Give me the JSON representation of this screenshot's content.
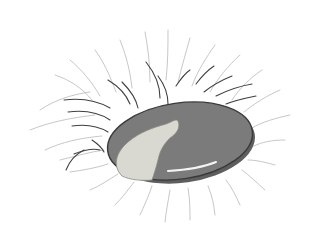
{
  "illustration": {
    "subject": "grey oval stone resting in a tuft of wispy hair strokes",
    "width": 324,
    "height": 249,
    "background": "#ffffff",
    "stone": {
      "cx": 180,
      "cy": 141,
      "rx": 73,
      "ry": 38,
      "rotate": -8,
      "fill": "#7b7b7b",
      "shade": "#5e5e5e",
      "outline": "#3a3a3a"
    },
    "patch": {
      "fill": "#d9d9d2",
      "outline": "#8a8a84",
      "d": "M122 176 C112 166 116 152 128 142 C140 132 152 128 166 124 C172 122 176 118 178 121 C181 128 176 134 170 138 C164 144 160 150 158 160 C156 168 154 174 152 180 C142 181 130 180 122 176 Z"
    },
    "highlight": {
      "stroke": "#f4f4f4",
      "d": "M168 171 C186 170 204 167 216 162"
    },
    "hair_light": {
      "color": "#b9b9b9",
      "width": 0.8,
      "paths": [
        "M40 110 C55 100 70 95 90 92",
        "M30 130 C50 122 70 118 95 115",
        "M45 150 C62 142 80 138 102 136",
        "M55 75 C70 80 82 88 92 100",
        "M70 60 C82 70 92 82 100 96",
        "M95 50 C104 62 110 76 116 92",
        "M120 40 C126 55 130 70 132 88",
        "M145 32 C148 48 150 64 150 82",
        "M168 30 C168 46 168 62 166 80",
        "M190 38 C186 52 182 66 178 82",
        "M215 45 C206 58 198 70 192 86",
        "M240 55 C228 66 218 78 210 92",
        "M262 70 C250 78 240 88 232 100",
        "M280 90 C266 96 254 104 244 112",
        "M290 115 C276 118 262 122 252 128",
        "M285 140 C272 140 262 142 254 146",
        "M275 165 C264 162 256 160 248 160",
        "M265 190 C256 182 250 176 242 170",
        "M240 205 C236 196 232 188 226 180",
        "M215 215 C214 204 212 196 208 186",
        "M190 220 C190 210 190 200 188 188",
        "M165 222 C166 212 168 202 170 190",
        "M140 215 C144 206 148 198 152 186",
        "M115 205 C122 198 128 190 134 182",
        "M90 190 C100 186 108 180 118 174",
        "M70 172 C84 170 96 168 108 164",
        "M60 160 C76 156 90 152 104 150"
      ]
    },
    "hair_dark": {
      "color": "#404040",
      "width": 1.1,
      "paths": [
        "M64 100 C80 98 96 100 110 108",
        "M68 112 C84 110 98 112 110 120",
        "M72 126 C86 124 98 126 108 132",
        "M108 80 C118 86 126 94 130 104",
        "M122 82 C130 90 136 98 138 108",
        "M146 62 C154 72 160 84 160 98",
        "M158 76 C164 84 168 94 168 104",
        "M176 86 C180 80 184 74 190 70",
        "M196 84 C202 76 208 70 214 66",
        "M204 92 C214 84 222 80 232 76",
        "M216 96 C228 90 240 86 252 84",
        "M226 104 C236 100 246 98 256 96",
        "M74 154 C84 150 92 148 100 150",
        "M66 170 C70 160 76 154 84 150",
        "M92 140 C98 144 102 148 104 152"
      ]
    }
  }
}
